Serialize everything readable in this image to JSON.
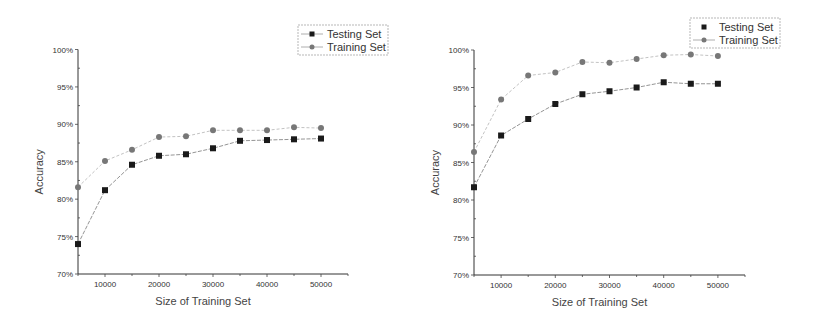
{
  "chart_data": [
    {
      "type": "line",
      "title": "",
      "xlabel": "Size of Training Set",
      "ylabel": "Accuracy",
      "x": [
        5000,
        10000,
        15000,
        20000,
        25000,
        30000,
        35000,
        40000,
        45000,
        50000
      ],
      "xticks": [
        10000,
        20000,
        30000,
        40000,
        50000
      ],
      "xtick_labels": [
        "10000",
        "20000",
        "30000",
        "40000",
        "50000"
      ],
      "xlim": [
        5000,
        55000
      ],
      "yticks": [
        70,
        75,
        80,
        85,
        90,
        95,
        100
      ],
      "ytick_labels": [
        "70%",
        "75%",
        "80%",
        "85%",
        "90%",
        "95%",
        "100%"
      ],
      "ylim": [
        70,
        100
      ],
      "grid": false,
      "legend_position": "top-right",
      "series": [
        {
          "name": "Testing Set",
          "marker": "square",
          "color": "#1a1a1a",
          "values": [
            74.0,
            81.2,
            84.6,
            85.8,
            86.0,
            86.8,
            87.8,
            87.9,
            88.0,
            88.1
          ]
        },
        {
          "name": "Training Set",
          "marker": "circle",
          "color": "#777777",
          "values": [
            81.6,
            85.1,
            86.6,
            88.3,
            88.4,
            89.2,
            89.2,
            89.2,
            89.6,
            89.5
          ]
        }
      ]
    },
    {
      "type": "line",
      "title": "",
      "xlabel": "Size of Training Set",
      "ylabel": "Accuracy",
      "x": [
        5000,
        10000,
        15000,
        20000,
        25000,
        30000,
        35000,
        40000,
        45000,
        50000
      ],
      "xticks": [
        10000,
        20000,
        30000,
        40000,
        50000
      ],
      "xtick_labels": [
        "10000",
        "20000",
        "30000",
        "40000",
        "50000"
      ],
      "xlim": [
        5000,
        55000
      ],
      "yticks": [
        70,
        75,
        80,
        85,
        90,
        95,
        100
      ],
      "ytick_labels": [
        "70%",
        "75%",
        "80%",
        "85%",
        "90%",
        "95%",
        "100%"
      ],
      "ylim": [
        70,
        100
      ],
      "grid": false,
      "legend_position": "top-right",
      "series": [
        {
          "name": "Testing Set",
          "marker": "square",
          "color": "#1a1a1a",
          "values": [
            81.7,
            88.6,
            90.8,
            92.8,
            94.1,
            94.5,
            95.0,
            95.7,
            95.5,
            95.5
          ]
        },
        {
          "name": "Training Set",
          "marker": "circle",
          "color": "#777777",
          "values": [
            86.4,
            93.4,
            96.6,
            97.0,
            98.4,
            98.3,
            98.8,
            99.3,
            99.4,
            99.2
          ]
        }
      ]
    }
  ],
  "layout": [
    {
      "left": 0,
      "axis_x0": 78,
      "axis_x1": 348,
      "axis_y_top": 49.5,
      "axis_y_bottom": 274,
      "legend": {
        "x": 298,
        "y": 25,
        "w": 90,
        "h": 30
      }
    },
    {
      "left": 0,
      "axis_x0": 474,
      "axis_x1": 745,
      "axis_y_top": 50,
      "axis_y_bottom": 275,
      "legend": {
        "x": 690,
        "y": 18,
        "w": 90,
        "h": 30
      }
    }
  ]
}
